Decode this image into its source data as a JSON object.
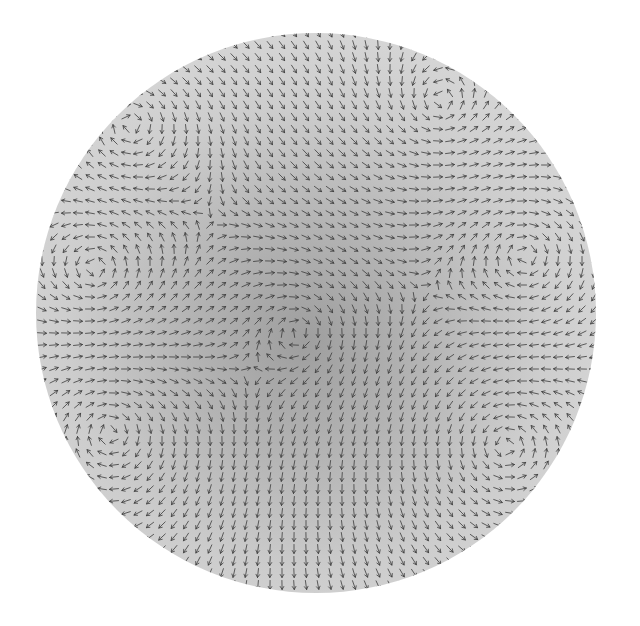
{
  "figure": {
    "type": "vector-field-visualization",
    "disk": {
      "cx": 316,
      "cy": 313,
      "r": 280
    },
    "colors": {
      "background": "#ffffff",
      "disk_fill": "#c8c8c8",
      "disk_light": "#dcdcdc",
      "center_dark": "#9a9a9a",
      "arrow_stroke": "#3a3a3a"
    },
    "vortices": [
      {
        "x": 130,
        "y": 125,
        "strength": 1.0
      },
      {
        "x": 95,
        "y": 270,
        "strength": -1.0
      },
      {
        "x": 110,
        "y": 430,
        "strength": 1.0
      },
      {
        "x": 440,
        "y": 105,
        "strength": -0.8
      },
      {
        "x": 525,
        "y": 255,
        "strength": 1.0
      },
      {
        "x": 505,
        "y": 445,
        "strength": -1.0
      },
      {
        "x": 300,
        "y": 330,
        "strength": 0.5
      }
    ],
    "grid_spacing": 12
  }
}
